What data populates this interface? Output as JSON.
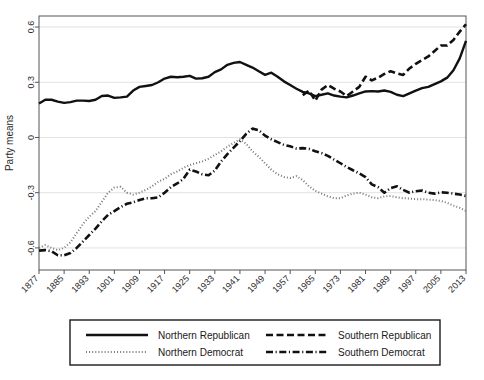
{
  "chart_data": {
    "type": "line",
    "title": "",
    "xlabel": "",
    "ylabel": "Party means",
    "xlim": [
      1877,
      2013
    ],
    "ylim": [
      -0.72,
      0.66
    ],
    "grid": true,
    "gridlines_y": [
      -0.6,
      -0.3,
      0,
      0.3,
      0.6
    ],
    "ytick_labels": [
      "-0.6",
      "-0.3",
      "0",
      "0.3",
      "0.6"
    ],
    "ytick_values": [
      -0.6,
      -0.3,
      0,
      0.3,
      0.6
    ],
    "xtick_labels": [
      "1877",
      "1885",
      "1893",
      "1901",
      "1909",
      "1917",
      "1925",
      "1933",
      "1941",
      "1949",
      "1957",
      "1965",
      "1973",
      "1981",
      "1989",
      "1997",
      "2005",
      "2013"
    ],
    "xtick_values": [
      1877,
      1885,
      1893,
      1901,
      1909,
      1917,
      1925,
      1933,
      1941,
      1949,
      1957,
      1965,
      1973,
      1981,
      1989,
      1997,
      2005,
      2013
    ],
    "legend_position": "below",
    "series": [
      {
        "name": "Northern Republican",
        "style": "solid",
        "color": "#111111",
        "x": [
          1877,
          1879,
          1881,
          1883,
          1885,
          1887,
          1889,
          1891,
          1893,
          1895,
          1897,
          1899,
          1901,
          1903,
          1905,
          1907,
          1909,
          1911,
          1913,
          1915,
          1917,
          1919,
          1921,
          1923,
          1925,
          1927,
          1929,
          1931,
          1933,
          1935,
          1937,
          1939,
          1941,
          1943,
          1945,
          1947,
          1949,
          1951,
          1953,
          1955,
          1957,
          1959,
          1961,
          1963,
          1965,
          1967,
          1969,
          1971,
          1973,
          1975,
          1977,
          1979,
          1981,
          1983,
          1985,
          1987,
          1989,
          1991,
          1993,
          1995,
          1997,
          1999,
          2001,
          2003,
          2005,
          2007,
          2009,
          2011,
          2013
        ],
        "y": [
          0.185,
          0.205,
          0.205,
          0.195,
          0.188,
          0.192,
          0.2,
          0.2,
          0.198,
          0.205,
          0.225,
          0.228,
          0.215,
          0.218,
          0.222,
          0.255,
          0.275,
          0.28,
          0.285,
          0.3,
          0.32,
          0.33,
          0.327,
          0.33,
          0.335,
          0.32,
          0.322,
          0.33,
          0.355,
          0.37,
          0.395,
          0.405,
          0.41,
          0.395,
          0.38,
          0.36,
          0.34,
          0.352,
          0.33,
          0.305,
          0.285,
          0.265,
          0.248,
          0.24,
          0.225,
          0.232,
          0.24,
          0.228,
          0.222,
          0.218,
          0.228,
          0.24,
          0.25,
          0.252,
          0.25,
          0.255,
          0.248,
          0.232,
          0.225,
          0.24,
          0.255,
          0.268,
          0.275,
          0.29,
          0.305,
          0.325,
          0.365,
          0.43,
          0.525
        ]
      },
      {
        "name": "Southern Republican",
        "style": "dashed",
        "color": "#111111",
        "x": [
          1961,
          1963,
          1965,
          1967,
          1969,
          1971,
          1973,
          1975,
          1977,
          1979,
          1981,
          1983,
          1985,
          1987,
          1989,
          1991,
          1993,
          1995,
          1997,
          1999,
          2001,
          2003,
          2005,
          2007,
          2009,
          2011,
          2013
        ],
        "y": [
          0.23,
          0.255,
          0.2,
          0.26,
          0.285,
          0.265,
          0.25,
          0.225,
          0.25,
          0.275,
          0.33,
          0.31,
          0.325,
          0.345,
          0.36,
          0.348,
          0.34,
          0.375,
          0.4,
          0.42,
          0.44,
          0.47,
          0.5,
          0.5,
          0.53,
          0.575,
          0.615
        ]
      },
      {
        "name": "Northern Democrat",
        "style": "dotted",
        "color": "#777777",
        "x": [
          1877,
          1879,
          1881,
          1883,
          1885,
          1887,
          1889,
          1891,
          1893,
          1895,
          1897,
          1899,
          1901,
          1903,
          1905,
          1907,
          1909,
          1911,
          1913,
          1915,
          1917,
          1919,
          1921,
          1923,
          1925,
          1927,
          1929,
          1931,
          1933,
          1935,
          1937,
          1939,
          1941,
          1943,
          1945,
          1947,
          1949,
          1951,
          1953,
          1955,
          1957,
          1959,
          1961,
          1963,
          1965,
          1967,
          1969,
          1971,
          1973,
          1975,
          1977,
          1979,
          1981,
          1983,
          1985,
          1987,
          1989,
          1991,
          1993,
          1995,
          1997,
          1999,
          2001,
          2003,
          2005,
          2007,
          2009,
          2011,
          2013
        ],
        "y": [
          -0.6,
          -0.585,
          -0.6,
          -0.612,
          -0.6,
          -0.57,
          -0.52,
          -0.47,
          -0.43,
          -0.4,
          -0.35,
          -0.3,
          -0.272,
          -0.268,
          -0.3,
          -0.31,
          -0.3,
          -0.285,
          -0.265,
          -0.24,
          -0.225,
          -0.2,
          -0.185,
          -0.165,
          -0.15,
          -0.14,
          -0.13,
          -0.115,
          -0.095,
          -0.075,
          -0.05,
          -0.03,
          -0.01,
          -0.035,
          -0.075,
          -0.105,
          -0.14,
          -0.175,
          -0.2,
          -0.215,
          -0.22,
          -0.21,
          -0.232,
          -0.265,
          -0.29,
          -0.305,
          -0.32,
          -0.33,
          -0.33,
          -0.315,
          -0.305,
          -0.3,
          -0.31,
          -0.325,
          -0.33,
          -0.32,
          -0.318,
          -0.325,
          -0.33,
          -0.332,
          -0.335,
          -0.335,
          -0.338,
          -0.34,
          -0.345,
          -0.355,
          -0.37,
          -0.382,
          -0.4
        ]
      },
      {
        "name": "Southern Democrat",
        "style": "dashdot",
        "color": "#111111",
        "x": [
          1877,
          1879,
          1881,
          1883,
          1885,
          1887,
          1889,
          1891,
          1893,
          1895,
          1897,
          1899,
          1901,
          1903,
          1905,
          1907,
          1909,
          1911,
          1913,
          1915,
          1917,
          1919,
          1921,
          1923,
          1925,
          1927,
          1929,
          1931,
          1933,
          1935,
          1937,
          1939,
          1941,
          1943,
          1945,
          1947,
          1949,
          1951,
          1953,
          1955,
          1957,
          1959,
          1961,
          1963,
          1965,
          1967,
          1969,
          1971,
          1973,
          1975,
          1977,
          1979,
          1981,
          1983,
          1985,
          1987,
          1989,
          1991,
          1993,
          1995,
          1997,
          1999,
          2001,
          2003,
          2005,
          2007,
          2009,
          2011,
          2013
        ],
        "y": [
          -0.615,
          -0.612,
          -0.618,
          -0.64,
          -0.64,
          -0.628,
          -0.6,
          -0.565,
          -0.53,
          -0.495,
          -0.455,
          -0.42,
          -0.4,
          -0.378,
          -0.36,
          -0.352,
          -0.34,
          -0.33,
          -0.33,
          -0.325,
          -0.3,
          -0.27,
          -0.25,
          -0.225,
          -0.175,
          -0.185,
          -0.2,
          -0.205,
          -0.18,
          -0.13,
          -0.09,
          -0.055,
          -0.02,
          0.02,
          0.048,
          0.04,
          0.01,
          -0.01,
          -0.025,
          -0.04,
          -0.048,
          -0.06,
          -0.058,
          -0.062,
          -0.075,
          -0.085,
          -0.1,
          -0.12,
          -0.14,
          -0.16,
          -0.178,
          -0.195,
          -0.215,
          -0.255,
          -0.27,
          -0.3,
          -0.275,
          -0.265,
          -0.285,
          -0.3,
          -0.292,
          -0.288,
          -0.3,
          -0.305,
          -0.298,
          -0.3,
          -0.305,
          -0.31,
          -0.318
        ]
      }
    ]
  },
  "legend": {
    "entries": [
      {
        "label": "Northern Republican",
        "style": "solid"
      },
      {
        "label": "Southern Republican",
        "style": "dashed"
      },
      {
        "label": "Northern Democrat",
        "style": "dotted"
      },
      {
        "label": "Southern Democrat",
        "style": "dashdot"
      }
    ]
  }
}
